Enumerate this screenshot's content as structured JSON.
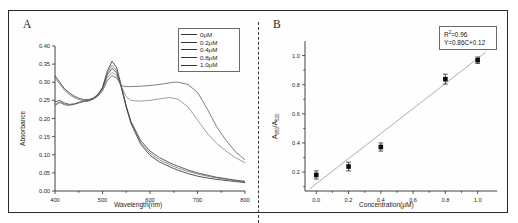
{
  "figure": {
    "panel_a_label": "A",
    "panel_b_label": "B"
  },
  "panelA": {
    "xlabel": "Wavelength(nm)",
    "ylabel": "Absorbance",
    "xticks": [
      "400",
      "500",
      "600",
      "700",
      "800"
    ],
    "yticks": [
      "0.00",
      "0.05",
      "0.10",
      "0.15",
      "0.20",
      "0.25",
      "0.30",
      "0.35",
      "0.40"
    ],
    "legend": [
      {
        "label": "0μM"
      },
      {
        "label": "0.2μM"
      },
      {
        "label": "0.4μM"
      },
      {
        "label": "0.8μM"
      },
      {
        "label": "1.0μM"
      }
    ]
  },
  "panelB": {
    "xlabel": "Concentration(μM)",
    "ylabel_main": "A",
    "ylabel_sub1": "650",
    "ylabel_sep": "/A",
    "ylabel_sub2": "520",
    "xticks": [
      "0.0",
      "0.2",
      "0.4",
      "0.6",
      "0.8",
      "1.0"
    ],
    "yticks": [
      "0.2",
      "0.4",
      "0.6",
      "0.8",
      "1.0"
    ],
    "annotation_r2_prefix": "R",
    "annotation_r2_sup": "2",
    "annotation_r2_value": "=0.96",
    "annotation_eq": "Y=0.86C+0.12"
  },
  "chart_data": [
    {
      "type": "line",
      "title": "A",
      "xlabel": "Wavelength(nm)",
      "ylabel": "Absorbance",
      "xlim": [
        400,
        800
      ],
      "ylim": [
        0.0,
        0.4
      ],
      "grid": false,
      "legend_position": "top-right",
      "x": [
        400,
        410,
        420,
        430,
        440,
        450,
        460,
        470,
        480,
        490,
        500,
        510,
        520,
        530,
        540,
        550,
        560,
        580,
        600,
        620,
        640,
        650,
        660,
        680,
        700,
        720,
        740,
        760,
        780,
        800
      ],
      "series": [
        {
          "name": "0μM",
          "values": [
            0.318,
            0.3,
            0.282,
            0.271,
            0.262,
            0.256,
            0.252,
            0.252,
            0.256,
            0.266,
            0.286,
            0.33,
            0.358,
            0.34,
            0.288,
            0.232,
            0.186,
            0.13,
            0.098,
            0.08,
            0.068,
            0.062,
            0.057,
            0.048,
            0.041,
            0.036,
            0.032,
            0.029,
            0.026,
            0.023
          ]
        },
        {
          "name": "0.2μM",
          "values": [
            0.312,
            0.295,
            0.278,
            0.266,
            0.258,
            0.252,
            0.249,
            0.249,
            0.254,
            0.264,
            0.284,
            0.325,
            0.347,
            0.331,
            0.284,
            0.231,
            0.188,
            0.135,
            0.104,
            0.086,
            0.074,
            0.068,
            0.063,
            0.054,
            0.047,
            0.041,
            0.036,
            0.032,
            0.028,
            0.025
          ]
        },
        {
          "name": "0.4μM",
          "values": [
            0.246,
            0.25,
            0.243,
            0.239,
            0.24,
            0.244,
            0.247,
            0.249,
            0.254,
            0.264,
            0.283,
            0.32,
            0.338,
            0.326,
            0.284,
            0.234,
            0.192,
            0.14,
            0.11,
            0.092,
            0.079,
            0.073,
            0.068,
            0.058,
            0.05,
            0.044,
            0.038,
            0.034,
            0.03,
            0.027
          ]
        },
        {
          "name": "0.8μM",
          "values": [
            0.24,
            0.246,
            0.24,
            0.238,
            0.24,
            0.244,
            0.248,
            0.25,
            0.255,
            0.263,
            0.28,
            0.312,
            0.327,
            0.318,
            0.288,
            0.26,
            0.25,
            0.248,
            0.25,
            0.254,
            0.258,
            0.256,
            0.252,
            0.232,
            0.196,
            0.16,
            0.132,
            0.11,
            0.092,
            0.078
          ]
        },
        {
          "name": "1.0μM",
          "values": [
            0.236,
            0.244,
            0.238,
            0.236,
            0.239,
            0.243,
            0.247,
            0.249,
            0.253,
            0.261,
            0.276,
            0.305,
            0.318,
            0.312,
            0.29,
            0.288,
            0.288,
            0.289,
            0.291,
            0.294,
            0.298,
            0.3,
            0.3,
            0.294,
            0.272,
            0.228,
            0.178,
            0.14,
            0.108,
            0.086
          ]
        }
      ]
    },
    {
      "type": "scatter",
      "title": "B",
      "xlabel": "Concentration(μM)",
      "ylabel": "A650/A520",
      "xlim": [
        -0.07,
        1.12
      ],
      "ylim": [
        0.07,
        1.1
      ],
      "grid": false,
      "points": [
        {
          "x": 0.0,
          "y": 0.18,
          "yerr": 0.028
        },
        {
          "x": 0.2,
          "y": 0.238,
          "yerr": 0.03
        },
        {
          "x": 0.4,
          "y": 0.372,
          "yerr": 0.028
        },
        {
          "x": 0.8,
          "y": 0.838,
          "yerr": 0.034
        },
        {
          "x": 1.0,
          "y": 0.968,
          "yerr": 0.022
        }
      ],
      "fit": {
        "slope": 0.86,
        "intercept": 0.12,
        "r2": 0.96,
        "equation": "Y=0.86C+0.12",
        "x_range": [
          -0.04,
          1.05
        ]
      },
      "annotations": [
        "R2=0.96",
        "Y=0.86C+0.12"
      ]
    }
  ]
}
